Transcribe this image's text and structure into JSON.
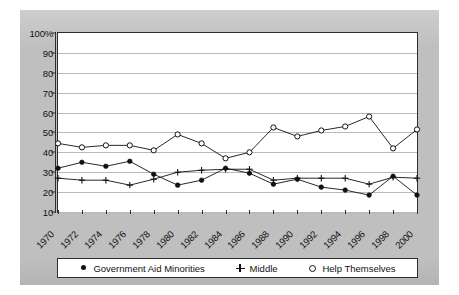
{
  "chart_data": {
    "type": "line",
    "title": "",
    "subtitle": "",
    "xlabel": "",
    "ylabel": "",
    "ylim": [
      10,
      100
    ],
    "grid": true,
    "legend_position": "bottom",
    "categories": [
      "1970",
      "1972",
      "1974",
      "1976",
      "1978",
      "1980",
      "1982",
      "1984",
      "1986",
      "1988",
      "1990",
      "1992",
      "1994",
      "1996",
      "1998",
      "2000"
    ],
    "ytick_labels": [
      "100%",
      "90",
      "80",
      "70",
      "60",
      "50",
      "40",
      "30",
      "20",
      "10"
    ],
    "ytick_values": [
      100,
      90,
      80,
      70,
      60,
      50,
      40,
      30,
      20,
      10
    ],
    "series": [
      {
        "name": "Government Aid Minorities",
        "marker": "filled-circle",
        "values": [
          32,
          35,
          33,
          35.5,
          29,
          23.5,
          26,
          32,
          29.5,
          24,
          26.5,
          22.5,
          21,
          18.5,
          28,
          18.5
        ]
      },
      {
        "name": "Middle",
        "marker": "plus",
        "values": [
          27,
          26,
          26,
          23.5,
          26.5,
          30,
          31,
          31.5,
          31.5,
          26,
          27,
          27,
          27,
          24,
          27.5,
          27
        ]
      },
      {
        "name": "Help Themselves",
        "marker": "open-circle",
        "values": [
          44.5,
          42.5,
          43.5,
          43.5,
          41,
          49,
          44.5,
          37,
          40,
          52.5,
          48,
          51,
          53,
          58,
          42,
          51.5
        ]
      }
    ]
  },
  "legend": {
    "items": [
      {
        "label": "Government Aid Minorities",
        "marker": "filled-circle"
      },
      {
        "label": "Middle",
        "marker": "plus"
      },
      {
        "label": "Help Themselves",
        "marker": "open-circle"
      }
    ]
  },
  "colors": {
    "panel": "#bfbfbf",
    "plot_background": "#ffffff",
    "ink": "#111111",
    "gridline": "#b9b9b9",
    "axis": "#2e2e2e"
  }
}
